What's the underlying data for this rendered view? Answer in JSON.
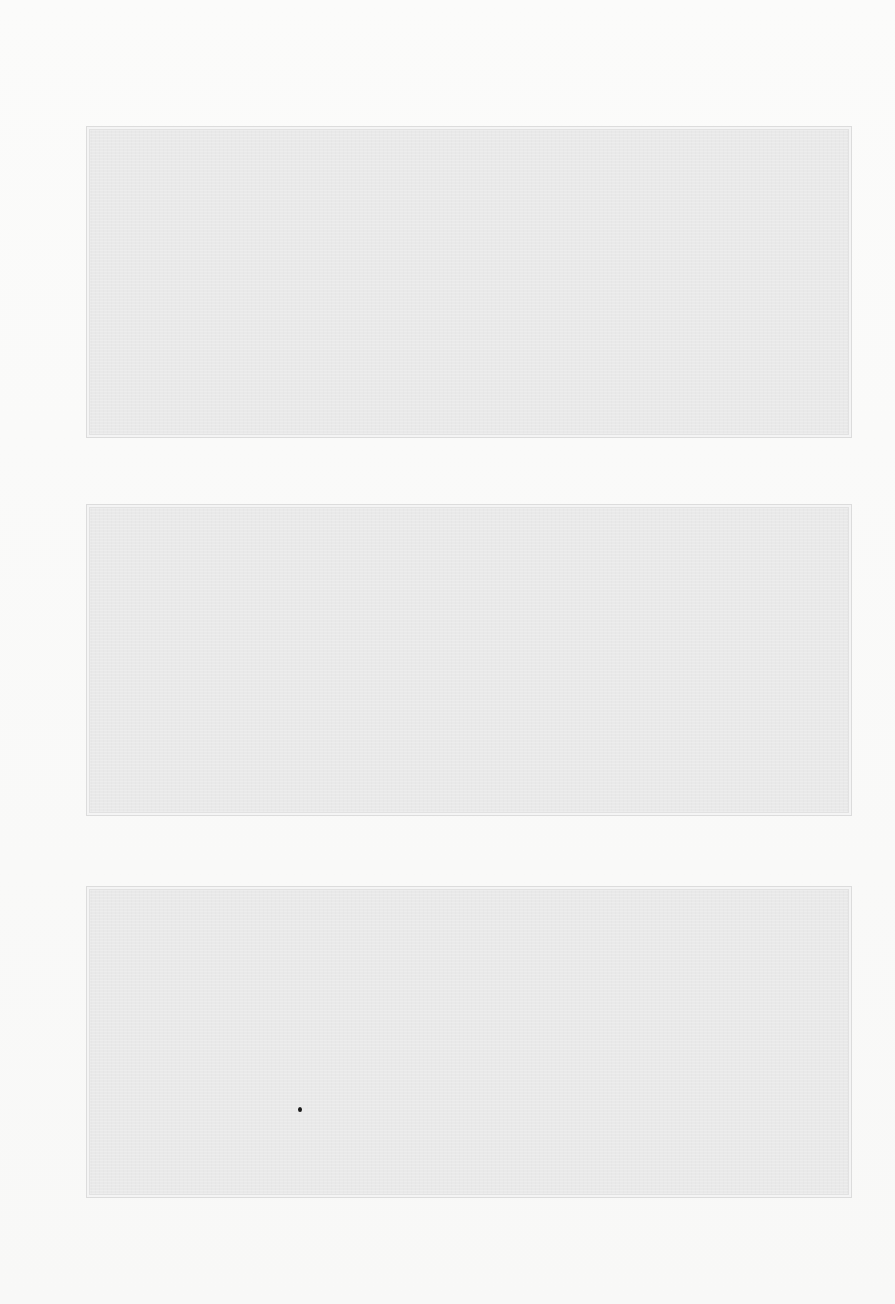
{
  "document": {
    "background_color": "#f9f9f8",
    "panel_color": "#e9e9e9",
    "panels": [
      {
        "id": "panel-1",
        "content": ""
      },
      {
        "id": "panel-2",
        "content": ""
      },
      {
        "id": "panel-3",
        "content": ""
      }
    ]
  }
}
